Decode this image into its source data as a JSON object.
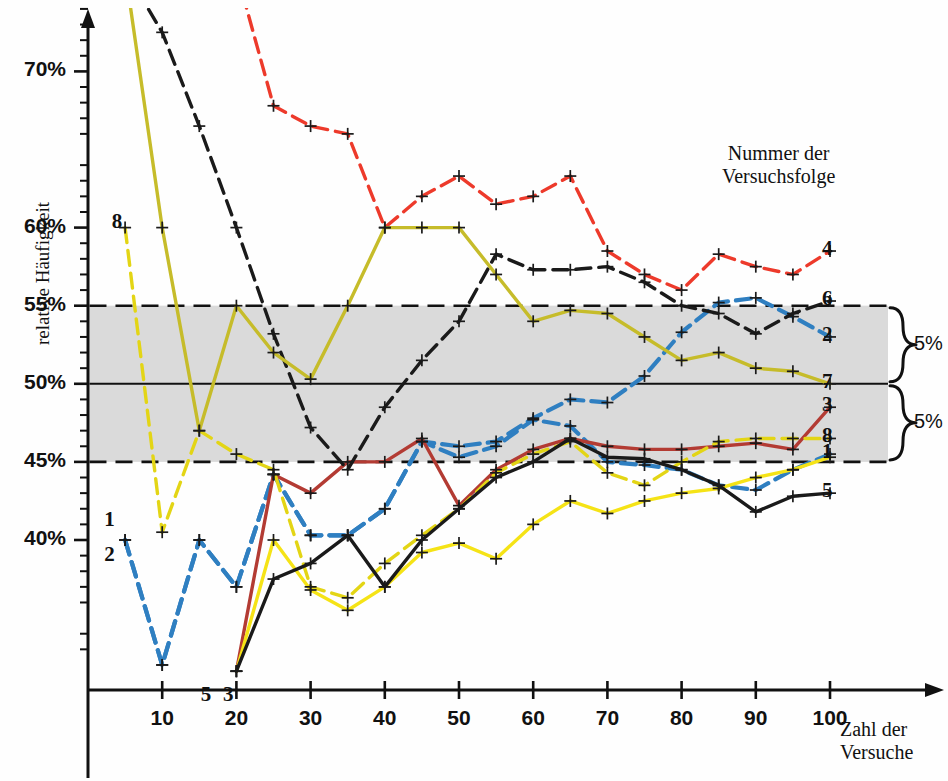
{
  "chart_data": {
    "type": "line",
    "title": "",
    "xlabel": "Zahl der Versuche",
    "ylabel": "relative Häufigkeit",
    "legend_title_line1": "Nummer der",
    "legend_title_line2": "Versuchsfolge",
    "xlim": [
      0,
      108
    ],
    "ylim": [
      31.5,
      76.5
    ],
    "xticks": [
      10,
      20,
      30,
      40,
      50,
      60,
      70,
      80,
      90,
      100
    ],
    "xtick_labels": [
      "10",
      "20",
      "30",
      "40",
      "50",
      "60",
      "70",
      "80",
      "90",
      "100"
    ],
    "yticks": [
      40,
      45,
      50,
      55,
      60,
      70
    ],
    "ytick_labels": [
      "40%",
      "45%",
      "50%",
      "55%",
      "60%",
      "70%"
    ],
    "yminor_step": 1,
    "grid": false,
    "band": {
      "lower": 45,
      "upper": 55,
      "center": 50,
      "fill": "#d4d4d4",
      "edge_style": "dashed",
      "center_style": "solid"
    },
    "brackets": [
      {
        "from": 50,
        "to": 55,
        "label": "5%"
      },
      {
        "from": 45,
        "to": 50,
        "label": "5%"
      }
    ],
    "marker": "plus",
    "series": [
      {
        "name": "1",
        "label": "1",
        "color": "#2f7fc1",
        "dash": "dash",
        "start_label": "1",
        "end_label": "1",
        "x": [
          5,
          10,
          15,
          20,
          25,
          30,
          35,
          40,
          45,
          50,
          55,
          60,
          65,
          70,
          75,
          80,
          85,
          90,
          95,
          100
        ],
        "y": [
          40.0,
          32.0,
          40.0,
          37.0,
          44.2,
          40.3,
          40.3,
          42.0,
          46.3,
          45.3,
          46.0,
          47.7,
          47.3,
          45.0,
          44.8,
          44.5,
          43.5,
          43.2,
          44.5,
          45.5
        ]
      },
      {
        "name": "2",
        "label": "2",
        "color": "#2f7fc1",
        "dash": "dash",
        "start_label": "2",
        "end_label": "2",
        "x": [
          5,
          10,
          15,
          20,
          25,
          30,
          35,
          40,
          45,
          50,
          55,
          60,
          65,
          70,
          75,
          80,
          85,
          90,
          95,
          100
        ],
        "y": [
          40.0,
          32.0,
          40.0,
          37.0,
          44.2,
          40.3,
          40.3,
          42.0,
          46.3,
          46.0,
          46.3,
          47.8,
          49.0,
          48.8,
          50.5,
          53.3,
          55.2,
          55.5,
          54.3,
          53.0
        ]
      },
      {
        "name": "3",
        "label": "3",
        "color": "#b33b33",
        "dash": "solid",
        "start_label": "3",
        "end_label": "3",
        "x": [
          20,
          25,
          30,
          35,
          40,
          45,
          50,
          55,
          60,
          65,
          70,
          75,
          80,
          85,
          90,
          95,
          100
        ],
        "y": [
          31.6,
          44.2,
          43.0,
          45.0,
          45.0,
          46.5,
          42.2,
          44.5,
          45.8,
          46.5,
          46.0,
          45.8,
          45.8,
          46.0,
          46.2,
          45.8,
          48.5
        ]
      },
      {
        "name": "4",
        "label": "4",
        "color": "#ed3a2b",
        "dash": "dash",
        "start_label": "4",
        "end_label": "4",
        "x": [
          20,
          25,
          30,
          35,
          40,
          45,
          50,
          55,
          60,
          65,
          70,
          75,
          80,
          85,
          90,
          95,
          100
        ],
        "y": [
          76.4,
          67.8,
          66.5,
          66.0,
          60.0,
          62.0,
          63.3,
          61.5,
          62.0,
          63.3,
          58.5,
          57.0,
          56.0,
          58.3,
          57.5,
          57.0,
          58.5
        ]
      },
      {
        "name": "5",
        "label": "5",
        "color": "#f5e316",
        "dash": "solid",
        "start_label": "",
        "end_label": "5",
        "x": [
          20,
          25,
          30,
          35,
          40,
          45,
          50,
          55,
          60,
          65,
          70,
          75,
          80,
          85,
          90,
          95,
          100
        ],
        "y": [
          31.6,
          40.0,
          36.8,
          35.5,
          37.0,
          39.2,
          39.8,
          38.8,
          41.0,
          42.5,
          41.7,
          42.5,
          43.0,
          43.3,
          44.0,
          44.5,
          45.3
        ]
      },
      {
        "name": "6",
        "label": "6",
        "color": "#1a1a1a",
        "dash": "dash",
        "start_label": "6",
        "end_label": "6",
        "x": [
          5,
          10,
          15,
          20,
          25,
          30,
          35,
          40,
          45,
          50,
          55,
          60,
          65,
          70,
          75,
          80,
          85,
          90,
          95,
          100
        ],
        "y": [
          76.5,
          72.5,
          66.5,
          60.0,
          53.2,
          47.2,
          44.5,
          48.5,
          51.5,
          54.0,
          58.3,
          57.3,
          57.3,
          57.5,
          56.5,
          55.0,
          54.5,
          53.2,
          54.5,
          55.3
        ]
      },
      {
        "name": "7",
        "label": "7",
        "color": "#c6bc2a",
        "dash": "solid",
        "start_label": "7",
        "end_label": "7",
        "x": [
          5,
          10,
          15,
          20,
          25,
          30,
          35,
          40,
          45,
          50,
          55,
          60,
          65,
          70,
          75,
          80,
          85,
          90,
          95,
          100
        ],
        "y": [
          76.5,
          60.0,
          47.0,
          55.0,
          52.0,
          50.3,
          55.0,
          60.0,
          60.0,
          60.0,
          57.0,
          54.0,
          54.7,
          54.5,
          53.0,
          51.5,
          52.0,
          51.0,
          50.8,
          50.0
        ]
      },
      {
        "name": "8",
        "label": "8",
        "color": "#e3d515",
        "dash": "dash",
        "start_label": "8",
        "end_label": "8",
        "x": [
          5,
          10,
          15,
          20,
          25,
          30,
          35,
          40,
          45,
          50,
          55,
          60,
          65,
          70,
          75,
          80,
          85,
          90,
          95,
          100
        ],
        "y": [
          60.0,
          40.5,
          47.0,
          45.5,
          44.5,
          37.0,
          36.3,
          38.5,
          40.3,
          42.0,
          44.3,
          45.5,
          46.3,
          44.3,
          43.5,
          45.0,
          46.3,
          46.5,
          46.5,
          46.5
        ]
      },
      {
        "name": "5b",
        "label": "5",
        "color": "#1a1a1a",
        "dash": "solid",
        "start_label": "5",
        "end_label": "5",
        "x": [
          20,
          25,
          30,
          35,
          40,
          45,
          50,
          55,
          60,
          65,
          70,
          75,
          80,
          85,
          90,
          95,
          100
        ],
        "y": [
          31.6,
          37.5,
          38.5,
          40.3,
          37.0,
          40.0,
          42.0,
          44.0,
          45.0,
          46.5,
          45.3,
          45.2,
          44.5,
          43.5,
          41.8,
          42.8,
          43.0
        ]
      }
    ],
    "end_labels": [
      {
        "text": "4",
        "y": 58.5
      },
      {
        "text": "6",
        "y": 55.3
      },
      {
        "text": "2",
        "y": 53.0
      },
      {
        "text": "7",
        "y": 50.0
      },
      {
        "text": "3",
        "y": 48.5
      },
      {
        "text": "8",
        "y": 46.5
      },
      {
        "text": "1",
        "y": 45.5
      },
      {
        "text": "5",
        "y": 43.0
      }
    ],
    "start_labels": [
      {
        "text": "7",
        "x": 9,
        "y": 76.6
      },
      {
        "text": "6",
        "x": 13,
        "y": 76.6
      },
      {
        "text": "4",
        "x": 21,
        "y": 76.6
      },
      {
        "text": "8",
        "x": 4,
        "y": 60.3
      },
      {
        "text": "1",
        "x": 3,
        "y": 41.2
      },
      {
        "text": "2",
        "x": 3,
        "y": 39.0
      },
      {
        "text": "5",
        "x": 16,
        "y": 30.0
      },
      {
        "text": "3",
        "x": 19,
        "y": 30.0
      }
    ]
  }
}
